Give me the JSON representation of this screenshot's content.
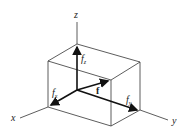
{
  "diagram": {
    "axes": {
      "x": "x",
      "y": "y",
      "z": "z"
    },
    "components": {
      "fx": "f",
      "fx_sub": "x",
      "fy": "f",
      "fy_sub": "y",
      "fz": "f",
      "fz_sub": "z"
    },
    "vector": "f"
  }
}
